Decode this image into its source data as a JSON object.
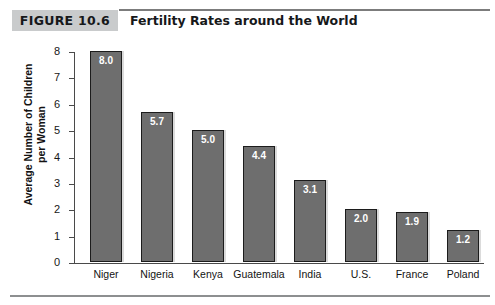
{
  "header": {
    "badge_label": "FIGURE 10.6",
    "title": "Fertility Rates around the World"
  },
  "chart_data": {
    "type": "bar",
    "title": "Fertility Rates around the World",
    "xlabel": "",
    "ylabel": "Average Number of Children per Woman",
    "ylabel_lines": [
      "Average Number of Children",
      "per Woman"
    ],
    "categories": [
      "Niger",
      "Nigeria",
      "Kenya",
      "Guatemala",
      "India",
      "U.S.",
      "France",
      "Poland"
    ],
    "values": [
      8.0,
      5.7,
      5.0,
      4.4,
      3.1,
      2.0,
      1.9,
      1.2
    ],
    "value_labels": [
      "8.0",
      "5.7",
      "5.0",
      "4.4",
      "3.1",
      "2.0",
      "1.9",
      "1.2"
    ],
    "ylim": [
      0,
      8
    ],
    "ytick_labels": [
      "8",
      "7",
      "6",
      "5",
      "4",
      "3",
      "2",
      "1",
      "0"
    ],
    "ytick_values": [
      8,
      7,
      6,
      5,
      4,
      3,
      2,
      1,
      0
    ],
    "grid": false,
    "legend": null,
    "colors": {
      "bar_fill": "#6e6e6e",
      "bar_border": "#1c1c1c",
      "value_text": "#ffffff",
      "axis": "#4a4a4a",
      "badge_bg": "#c9cbcc",
      "rule": "#7c7c7c",
      "background": "#ffffff"
    }
  }
}
